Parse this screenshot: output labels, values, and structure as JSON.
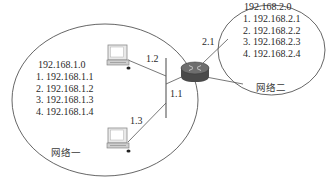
{
  "diagram": {
    "type": "network-topology",
    "colors": {
      "line": "#555555",
      "router_body": "#4a4a4a",
      "router_top": "#6e6e6e",
      "router_arrows": "#bdbdbd",
      "pc_screen": "#ffffff",
      "pc_frame": "#9a9a9a",
      "text": "#2a2a2a"
    }
  },
  "network1": {
    "name": "网络一",
    "address": "192.168.1.0",
    "hosts": [
      "1. 192.168.1.1",
      "2. 192.168.1.2",
      "3. 192.168.1.3",
      "4. 192.168.1.4"
    ]
  },
  "network2": {
    "name": "网络二",
    "address": "192.168.2.0",
    "hosts": [
      "1. 192.168.2.1",
      "2. 192.168.2.2",
      "3. 192.168.2.3",
      "4. 192.168.2.4"
    ]
  },
  "links": {
    "pc_top_port": "1.2",
    "pc_bottom_port": "1.3",
    "router_lan_port": "1.1",
    "router_wan_port": "2.1"
  },
  "nodes": {
    "pc_top": "computer-icon",
    "pc_bottom": "computer-icon",
    "router": "router-icon",
    "bus": "network-bus"
  }
}
